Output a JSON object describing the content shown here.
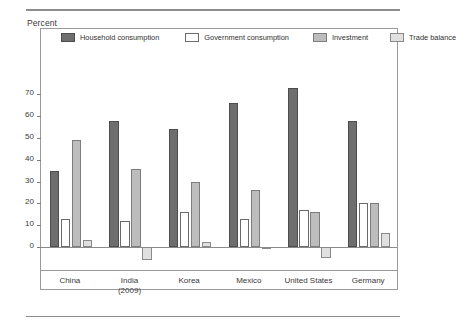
{
  "axis_title": "Percent",
  "legend": [
    {
      "label": "Household consumption",
      "key": "household",
      "color": "#6e6e6e"
    },
    {
      "label": "Government consumption",
      "key": "government",
      "color": "#ffffff"
    },
    {
      "label": "Investment",
      "key": "investment",
      "color": "#bdbdbd"
    },
    {
      "label": "Trade balance",
      "key": "trade",
      "color": "#e0e0e0"
    }
  ],
  "yticks": [
    "0",
    "10",
    "20",
    "30",
    "40",
    "50",
    "60",
    "70"
  ],
  "xlabels": [
    {
      "line1": "China",
      "line2": ""
    },
    {
      "line1": "India",
      "line2": "(2009)"
    },
    {
      "line1": "Korea",
      "line2": ""
    },
    {
      "line1": "Mexico",
      "line2": ""
    },
    {
      "line1": "United States",
      "line2": ""
    },
    {
      "line1": "Germany",
      "line2": ""
    }
  ],
  "chart_data": {
    "type": "bar",
    "title": "",
    "subtitle": "",
    "xlabel": "",
    "ylabel": "Percent",
    "ylim": [
      -10,
      75
    ],
    "yticks": [
      0,
      10,
      20,
      30,
      40,
      50,
      60,
      70
    ],
    "grid": false,
    "legend_position": "top-inside",
    "categories": [
      "China",
      "India (2009)",
      "Korea",
      "Mexico",
      "United States",
      "Germany"
    ],
    "series": [
      {
        "name": "Household consumption",
        "values": [
          35,
          58,
          54,
          66,
          73,
          58
        ]
      },
      {
        "name": "Government consumption",
        "values": [
          13,
          12,
          16,
          13,
          17,
          20
        ]
      },
      {
        "name": "Investment",
        "values": [
          49,
          36,
          30,
          26,
          16,
          20
        ]
      },
      {
        "name": "Trade balance",
        "values": [
          3,
          -6,
          2.5,
          -1,
          -5,
          6.5
        ]
      }
    ]
  }
}
